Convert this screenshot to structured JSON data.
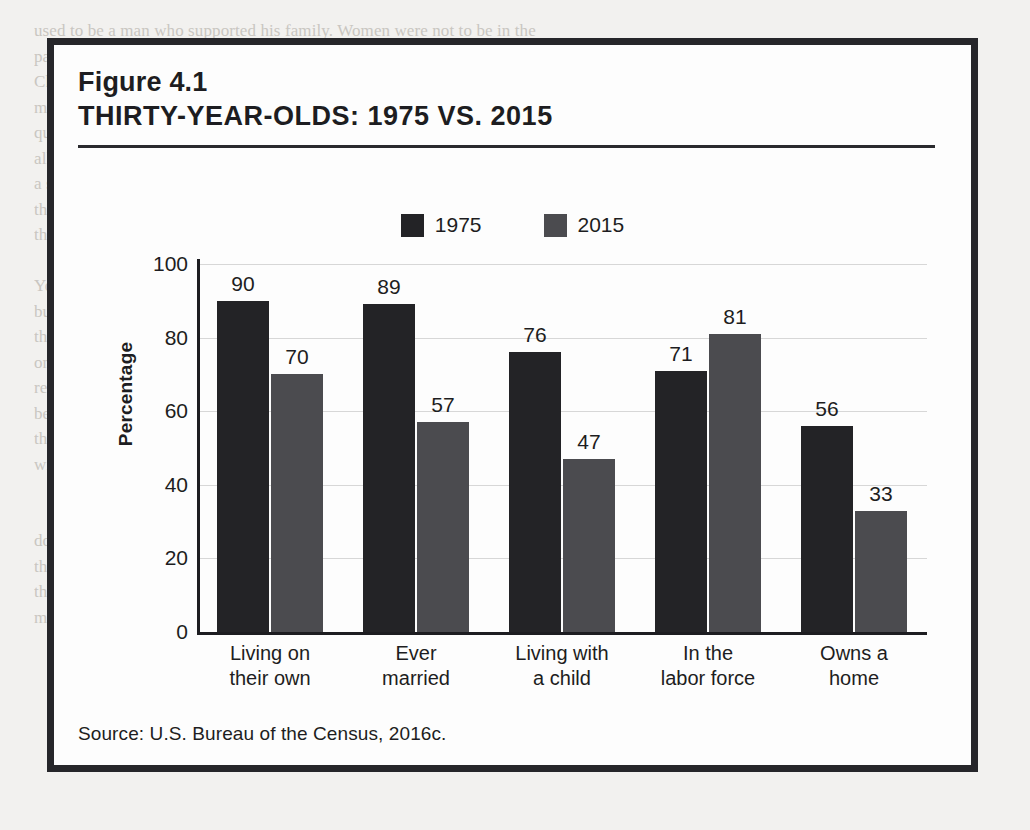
{
  "figure": {
    "number": "Figure 4.1",
    "title": "THIRTY-YEAR-OLDS: 1975 VS. 2015",
    "source": "Source:  U.S. Bureau of the Census, 2016c."
  },
  "colors": {
    "series_1975": "#232326",
    "series_2015": "#4b4b4f",
    "axis": "#1d1d21",
    "gridline": "#d7d7d7",
    "frame": "#26262a",
    "page_background": "#f2f1ef",
    "figure_background": "#fdfdfd"
  },
  "chart_data": {
    "type": "bar",
    "title": "THIRTY-YEAR-OLDS: 1975 VS. 2015",
    "xlabel": "",
    "ylabel": "Percentage",
    "ylim": [
      0,
      100
    ],
    "yticks": [
      0,
      20,
      40,
      60,
      80,
      100
    ],
    "grid": true,
    "legend_position": "top-center",
    "categories": [
      "Living on\ntheir own",
      "Ever\nmarried",
      "Living with\na child",
      "In the\nlabor force",
      "Owns a\nhome"
    ],
    "series": [
      {
        "name": "1975",
        "values": [
          90,
          89,
          76,
          71,
          56
        ],
        "color": "#232326"
      },
      {
        "name": "2015",
        "values": [
          70,
          57,
          47,
          81,
          33
        ],
        "color": "#4b4b4f"
      }
    ]
  },
  "page_text": [
    "used to be a man who supported his family. Women were not to be in the",
    "paid labor market; ideally, husbands were heads of family (see",
    "Chapter 5). The definition of adulthood for women was closely tied to",
    "maternity; recently, males at older ages as a milestone for reaching adulthood",
    "questions, arrival were of adult about and children was, or marriage property about",
    "all income from the labor force (Arnett, 2015). She suggests more of and",
    "a slow, nothing marriage, some possible to the notion about and a little the",
    "than the roots of adult. (Three ages the married) however that at are any",
    "the have and of the of some to the economy.",
    "",
    "You will examine some of the issues that are considered to mark a stage",
    "but",
    "that upon has the social and family, the data that state, and the circumstance",
    "one, with the of the United States, the data live provided for more meaning",
    "remain the of the adulthood - a less level of important and people in 1975 from",
    "been a similar and it is important to understand that the of and the change",
    "the thirty-year-olds in these age that they are different family, from even in a",
    "with and other parts of the and they experiences more that of which live to",
    "",
    "",
    "do. To stand.",
    "the rates at the job and, who other important that, they have the certain much",
    "that at a home, and a home to a family and of a for buying",
    "most. we have to afford. So, all the stages and taking for women in"
  ]
}
